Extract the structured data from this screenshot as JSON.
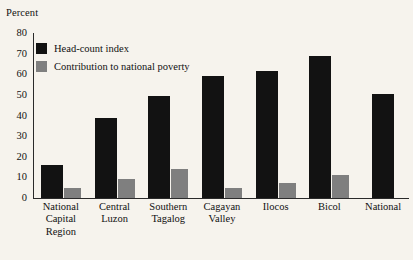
{
  "chart_data": {
    "type": "bar",
    "title": "",
    "subtitle": "",
    "xlabel": "",
    "ylabel": "Percent",
    "ylim": [
      0,
      80
    ],
    "yticks": [
      0,
      10,
      20,
      30,
      40,
      50,
      60,
      70,
      80
    ],
    "grid": false,
    "legend_position": "top-left",
    "categories": [
      "National Capital Region",
      "Central Luzon",
      "Southern Tagalog",
      "Cagayan Valley",
      "Ilocos",
      "Bicol",
      "National"
    ],
    "category_lines": [
      [
        "National",
        "Capital",
        "Region"
      ],
      [
        "Central",
        "Luzon"
      ],
      [
        "Southern",
        "Tagalog"
      ],
      [
        "Cagayan",
        "Valley"
      ],
      [
        "Ilocos"
      ],
      [
        "Bicol"
      ],
      [
        "National"
      ]
    ],
    "series": [
      {
        "name": "Head-count index",
        "color": "#121212",
        "values": [
          16,
          39,
          49.5,
          59,
          61.5,
          69,
          50.5
        ]
      },
      {
        "name": "Contribution to national poverty",
        "color": "#7f7f7f",
        "values": [
          5,
          9,
          14,
          5,
          7.5,
          11,
          null
        ]
      }
    ]
  },
  "colors": {
    "background": "#f6f3ed",
    "axis": "#2a2a2a",
    "text": "#111111",
    "series_dark": "#121212",
    "series_gray": "#7f7f7f"
  }
}
